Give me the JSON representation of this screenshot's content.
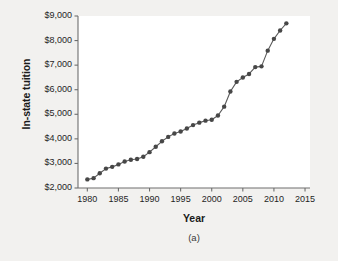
{
  "figure": {
    "caption": "(a)",
    "background_color": "#f2f1ef",
    "panel_color": "#ffffff",
    "marker_color": "#474747",
    "line_color": "#5a5a5a",
    "axis_color": "#6e6e6e"
  },
  "chart_data": {
    "type": "line",
    "title": "",
    "subtitle": "",
    "xlabel": "Year",
    "ylabel": "In-state tuition",
    "xlim": [
      1978.5,
      2015.8
    ],
    "ylim": [
      2000,
      9000
    ],
    "xticks": [
      1980,
      1985,
      1990,
      1995,
      2000,
      2005,
      2010,
      2015
    ],
    "xtick_labels": [
      "1980",
      "1985",
      "1990",
      "1995",
      "2000",
      "2005",
      "2010",
      "2015"
    ],
    "yticks": [
      2000,
      3000,
      4000,
      5000,
      6000,
      7000,
      8000,
      9000
    ],
    "ytick_labels": [
      "$2,000",
      "$3,000",
      "$4,000",
      "$5,000",
      "$6,000",
      "$7,000",
      "$8,000",
      "$9,000"
    ],
    "grid": false,
    "legend": null,
    "markers": true,
    "x": [
      1980,
      1981,
      1982,
      1983,
      1984,
      1985,
      1986,
      1987,
      1988,
      1989,
      1990,
      1991,
      1992,
      1993,
      1994,
      1995,
      1996,
      1997,
      1998,
      1999,
      2000,
      2001,
      2002,
      2003,
      2004,
      2005,
      2006,
      2007,
      2008,
      2009,
      2010,
      2011,
      2012
    ],
    "values": [
      2350,
      2400,
      2600,
      2790,
      2860,
      2960,
      3080,
      3150,
      3180,
      3270,
      3460,
      3680,
      3900,
      4080,
      4220,
      4300,
      4420,
      4560,
      4660,
      4740,
      4780,
      4950,
      5310,
      5930,
      6320,
      6500,
      6640,
      6920,
      6950,
      7590,
      8070,
      8410,
      8700
    ],
    "series": [
      {
        "name": "In-state tuition",
        "values": [
          2350,
          2400,
          2600,
          2790,
          2860,
          2960,
          3080,
          3150,
          3180,
          3270,
          3460,
          3680,
          3900,
          4080,
          4220,
          4300,
          4420,
          4560,
          4660,
          4740,
          4780,
          4950,
          5310,
          5930,
          6320,
          6500,
          6640,
          6920,
          6950,
          7590,
          8070,
          8410,
          8700
        ]
      }
    ]
  }
}
